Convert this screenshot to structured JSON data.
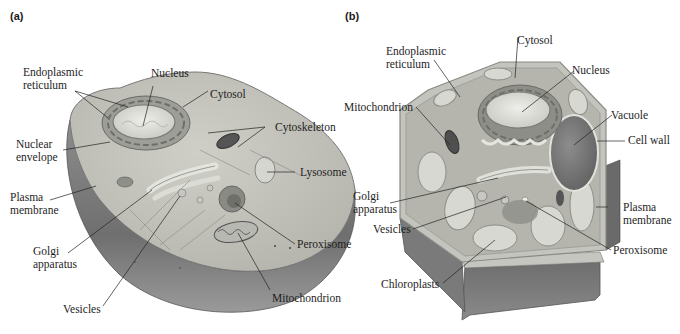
{
  "figure": {
    "panels": [
      {
        "id": "a",
        "label": "(a)",
        "subject": "animal-cell",
        "labels": {
          "endoplasmic_reticulum": [
            "Endoplasmic",
            "reticulum"
          ],
          "nucleus": "Nucleus",
          "cytosol": "Cytosol",
          "cytoskeleton": "Cytoskeleton",
          "nuclear_envelope": [
            "Nuclear",
            "envelope"
          ],
          "lysosome": "Lysosome",
          "plasma_membrane": [
            "Plasma",
            "membrane"
          ],
          "golgi_apparatus": [
            "Golgi",
            "apparatus"
          ],
          "peroxisome": "Peroxisome",
          "vesicles": "Vesicles",
          "mitochondrion": "Mitochondrion"
        }
      },
      {
        "id": "b",
        "label": "(b)",
        "subject": "plant-cell",
        "labels": {
          "cytosol": "Cytosol",
          "endoplasmic_reticulum": [
            "Endoplasmic",
            "reticulum"
          ],
          "nucleus": "Nucleus",
          "mitochondrion": "Mitochondrion",
          "vacuole": "Vacuole",
          "cell_wall": "Cell wall",
          "golgi_apparatus": [
            "Golgi",
            "apparatus"
          ],
          "plasma_membrane": [
            "Plasma",
            "membrane"
          ],
          "vesicles": "Vesicles",
          "peroxisome": "Peroxisome",
          "chloroplasts": "Chloroplasts"
        }
      }
    ]
  }
}
